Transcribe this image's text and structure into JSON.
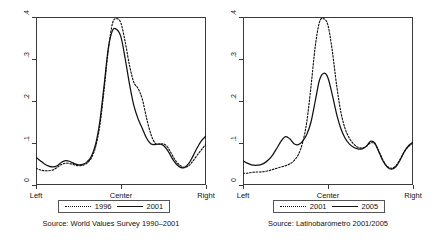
{
  "figure": {
    "kind": "two-panel kernel density plot",
    "background": "#ffffff",
    "line_color": "#111111"
  },
  "panels": [
    {
      "id": "left",
      "source_note": "Source: World Values Survey 1990–2001",
      "axis": {
        "y_ticks": [
          "0",
          ".1",
          ".2",
          ".3",
          ".4"
        ],
        "x_ticks": [
          "Left",
          "Center",
          "Right"
        ]
      },
      "legend": [
        {
          "label": "1996",
          "style": "dotted"
        },
        {
          "label": "2001",
          "style": "solid"
        }
      ]
    },
    {
      "id": "right",
      "source_note": "Source: Latinobarómetro 2001/2005",
      "axis": {
        "y_ticks": [
          "0",
          ".1",
          ".2",
          ".3",
          ".4"
        ],
        "x_ticks": [
          "Left",
          "Center",
          "Right"
        ]
      },
      "legend": [
        {
          "label": "2001",
          "style": "dotted"
        },
        {
          "label": "2005",
          "style": "solid"
        }
      ]
    }
  ],
  "chart_data": [
    {
      "type": "line",
      "panel": "left",
      "title": "",
      "subtitle": "Source: World Values Survey 1990–2001",
      "xlabel": "",
      "ylabel": "",
      "xlim": [
        0,
        10
      ],
      "ylim": [
        0,
        0.4
      ],
      "x_tick_positions": [
        0,
        5,
        10
      ],
      "x_tick_labels": [
        "Left",
        "Center",
        "Right"
      ],
      "y_ticks": [
        0,
        0.1,
        0.2,
        0.3,
        0.4
      ],
      "y_tick_labels": [
        "0",
        ".1",
        ".2",
        ".3",
        ".4"
      ],
      "grid": false,
      "legend_position": "below-axis",
      "x": [
        0.0,
        0.25,
        0.5,
        0.75,
        1.0,
        1.25,
        1.5,
        1.75,
        2.0,
        2.25,
        2.5,
        2.75,
        3.0,
        3.25,
        3.5,
        3.75,
        4.0,
        4.25,
        4.5,
        4.75,
        5.0,
        5.25,
        5.5,
        5.75,
        6.0,
        6.25,
        6.5,
        6.75,
        7.0,
        7.25,
        7.5,
        7.75,
        8.0,
        8.25,
        8.5,
        8.75,
        9.0,
        9.25,
        9.5,
        9.75,
        10.0
      ],
      "series": [
        {
          "name": "1996",
          "style": "dotted",
          "values": [
            0.04,
            0.036,
            0.034,
            0.034,
            0.036,
            0.042,
            0.049,
            0.052,
            0.051,
            0.048,
            0.046,
            0.047,
            0.052,
            0.064,
            0.09,
            0.14,
            0.225,
            0.32,
            0.385,
            0.396,
            0.385,
            0.34,
            0.285,
            0.245,
            0.23,
            0.205,
            0.16,
            0.122,
            0.1,
            0.097,
            0.098,
            0.09,
            0.072,
            0.056,
            0.046,
            0.042,
            0.046,
            0.058,
            0.072,
            0.085,
            0.098
          ]
        },
        {
          "name": "2001",
          "style": "solid",
          "values": [
            0.066,
            0.058,
            0.05,
            0.045,
            0.043,
            0.046,
            0.054,
            0.058,
            0.056,
            0.051,
            0.048,
            0.049,
            0.055,
            0.068,
            0.096,
            0.15,
            0.235,
            0.325,
            0.368,
            0.37,
            0.352,
            0.3,
            0.24,
            0.19,
            0.158,
            0.135,
            0.112,
            0.098,
            0.096,
            0.098,
            0.094,
            0.082,
            0.064,
            0.05,
            0.042,
            0.042,
            0.052,
            0.07,
            0.09,
            0.106,
            0.117
          ]
        }
      ]
    },
    {
      "type": "line",
      "panel": "right",
      "title": "",
      "subtitle": "Source: Latinobarómetro 2001/2005",
      "xlabel": "",
      "ylabel": "",
      "xlim": [
        0,
        10
      ],
      "ylim": [
        0,
        0.4
      ],
      "x_tick_positions": [
        0,
        5,
        10
      ],
      "x_tick_labels": [
        "Left",
        "Center",
        "Right"
      ],
      "y_ticks": [
        0,
        0.1,
        0.2,
        0.3,
        0.4
      ],
      "y_tick_labels": [
        "0",
        ".1",
        ".2",
        ".3",
        ".4"
      ],
      "grid": false,
      "legend_position": "below-axis",
      "x": [
        0.0,
        0.25,
        0.5,
        0.75,
        1.0,
        1.25,
        1.5,
        1.75,
        2.0,
        2.25,
        2.5,
        2.75,
        3.0,
        3.25,
        3.5,
        3.75,
        4.0,
        4.25,
        4.5,
        4.75,
        5.0,
        5.25,
        5.5,
        5.75,
        6.0,
        6.25,
        6.5,
        6.75,
        7.0,
        7.25,
        7.5,
        7.75,
        8.0,
        8.25,
        8.5,
        8.75,
        9.0,
        9.25,
        9.5,
        9.75,
        10.0
      ],
      "series": [
        {
          "name": "2001",
          "style": "dotted",
          "values": [
            0.028,
            0.028,
            0.03,
            0.031,
            0.031,
            0.032,
            0.034,
            0.037,
            0.04,
            0.043,
            0.046,
            0.05,
            0.058,
            0.072,
            0.1,
            0.15,
            0.235,
            0.33,
            0.388,
            0.396,
            0.38,
            0.32,
            0.24,
            0.175,
            0.135,
            0.112,
            0.098,
            0.09,
            0.088,
            0.092,
            0.1,
            0.098,
            0.08,
            0.058,
            0.044,
            0.04,
            0.046,
            0.062,
            0.08,
            0.092,
            0.1
          ]
        },
        {
          "name": "2005",
          "style": "solid",
          "values": [
            0.058,
            0.052,
            0.048,
            0.047,
            0.048,
            0.052,
            0.06,
            0.072,
            0.088,
            0.105,
            0.115,
            0.11,
            0.098,
            0.096,
            0.104,
            0.12,
            0.15,
            0.2,
            0.25,
            0.266,
            0.255,
            0.215,
            0.17,
            0.135,
            0.112,
            0.098,
            0.09,
            0.086,
            0.086,
            0.092,
            0.104,
            0.1,
            0.078,
            0.056,
            0.042,
            0.038,
            0.044,
            0.06,
            0.08,
            0.094,
            0.102
          ]
        }
      ]
    }
  ]
}
